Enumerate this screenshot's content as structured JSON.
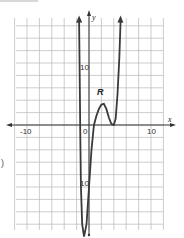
{
  "chart_data": {
    "type": "line",
    "title": "",
    "xlabel": "x",
    "ylabel": "y",
    "xlim": [
      -12,
      12
    ],
    "ylim": [
      -20,
      17
    ],
    "grid": true,
    "grid_step": 2,
    "x_tick_labels": [
      "-10",
      "0",
      "10"
    ],
    "y_tick_labels": [
      "10",
      "-10"
    ],
    "annotations": [
      {
        "text": "R",
        "x": 2.5,
        "y": 6
      }
    ],
    "series": [
      {
        "name": "curve",
        "points": [
          [
            -1.6,
            17
          ],
          [
            -1.5,
            8
          ],
          [
            -1.4,
            -2
          ],
          [
            -1.3,
            -10
          ],
          [
            -1.1,
            -16
          ],
          [
            -0.8,
            -18
          ],
          [
            -0.4,
            -16
          ],
          [
            0,
            -10
          ],
          [
            0.4,
            -4
          ],
          [
            0.8,
            0
          ],
          [
            1.2,
            1.5
          ],
          [
            1.6,
            2.6
          ],
          [
            2.0,
            3.3
          ],
          [
            2.4,
            3.4
          ],
          [
            2.8,
            2.6
          ],
          [
            3.2,
            1.2
          ],
          [
            3.6,
            0.2
          ],
          [
            4.0,
            0
          ],
          [
            4.3,
            1
          ],
          [
            4.6,
            5
          ],
          [
            4.9,
            11
          ],
          [
            5.1,
            17
          ]
        ],
        "arrow_ends": true
      }
    ]
  },
  "labels": {
    "x_axis": "x",
    "y_axis": "y",
    "tick_neg10": "-10",
    "tick_0": "0",
    "tick_10": "10",
    "tick_y10": "10",
    "tick_yneg10": "10",
    "region": "R",
    "edge_mark": ")"
  }
}
